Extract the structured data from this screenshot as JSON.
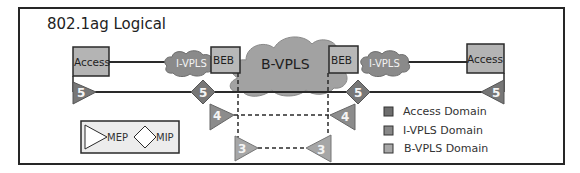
{
  "diagram": {
    "title": "802.1ag Logical",
    "colors": {
      "frame": "#262626",
      "access_fill": "#b4b4b4",
      "beb_fill": "#b8b8b8",
      "ivpls_cloud": "#8a8a8a",
      "bvpls_cloud": "#a2a2a2",
      "mep5": "#777777",
      "mep4": "#8c8c8c",
      "mep3": "#a6a6a6",
      "line": "#2a2a2a"
    },
    "nodes": {
      "access_left": "Access",
      "access_right": "Access",
      "beb_left": "BEB",
      "beb_right": "BEB",
      "ivpls_left": "I-VPLS",
      "ivpls_right": "I-VPLS",
      "bvpls": "B-VPLS"
    },
    "md_levels": [
      {
        "level": "5",
        "label": "5",
        "domain": "Access Domain",
        "points": [
          "MEP",
          "MIP",
          "MIP",
          "MEP"
        ]
      },
      {
        "level": "4",
        "label": "4",
        "domain": "I-VPLS Domain",
        "points": [
          "MEP",
          "MEP"
        ]
      },
      {
        "level": "3",
        "label": "3",
        "domain": "B-VPLS Domain",
        "points": [
          "MEP",
          "MEP"
        ]
      }
    ],
    "symbol_key": {
      "mep": "MEP",
      "mip": "MIP"
    },
    "legend": [
      {
        "label": "Access Domain",
        "color": "#6e6e6e"
      },
      {
        "label": "I-VPLS Domain",
        "color": "#888888"
      },
      {
        "label": "B-VPLS Domain",
        "color": "#a8a8a8"
      }
    ]
  }
}
